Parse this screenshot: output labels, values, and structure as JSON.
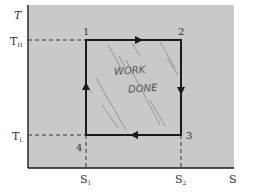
{
  "diagram": {
    "axes": {
      "y_label": "T",
      "x_label": "S",
      "y_ticks": [
        {
          "label": "T_H",
          "main": "T",
          "sub": "H"
        },
        {
          "label": "T_L",
          "main": "T",
          "sub": "L"
        }
      ],
      "x_ticks": [
        {
          "label": "S_1",
          "main": "S",
          "sub": "1"
        },
        {
          "label": "S_2",
          "main": "S",
          "sub": "2"
        }
      ]
    },
    "states": [
      {
        "id": "1",
        "T": "T_H",
        "S": "S_1"
      },
      {
        "id": "2",
        "T": "T_H",
        "S": "S_2"
      },
      {
        "id": "3",
        "T": "T_L",
        "S": "S_2"
      },
      {
        "id": "4",
        "T": "T_L",
        "S": "S_1"
      }
    ],
    "processes": [
      {
        "from": "1",
        "to": "2",
        "direction": "right"
      },
      {
        "from": "2",
        "to": "3",
        "direction": "down"
      },
      {
        "from": "3",
        "to": "4",
        "direction": "left"
      },
      {
        "from": "4",
        "to": "1",
        "direction": "up"
      }
    ],
    "annotation": {
      "line1": "WORK",
      "line2": "DONE"
    },
    "colors": {
      "panel": "#c9c9c9",
      "line": "#1a1a1a",
      "hatch": "#8a8a8a",
      "background": "#ffffff"
    }
  }
}
